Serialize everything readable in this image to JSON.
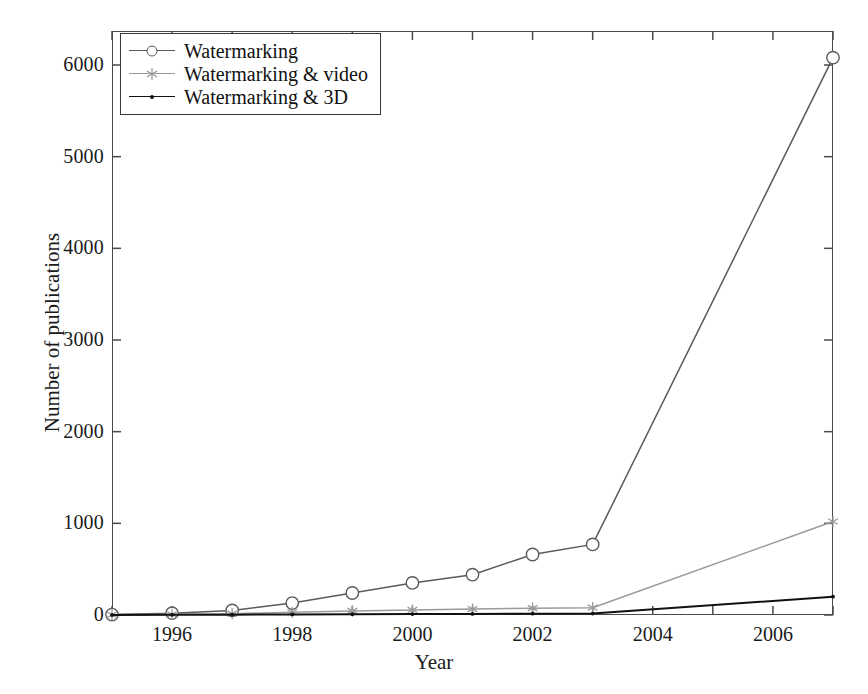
{
  "figure": {
    "background": "#ffffff",
    "frame_color": "#4a4a4a"
  },
  "axes": {
    "xlabel": "Year",
    "ylabel": "Number of publications",
    "x_tick_labels": [
      "1996",
      "1998",
      "2000",
      "2002",
      "2004",
      "2006"
    ],
    "y_tick_labels": [
      "0",
      "1000",
      "2000",
      "3000",
      "4000",
      "5000",
      "6000"
    ]
  },
  "legend": {
    "position": "top-left-inside",
    "entries": [
      {
        "label": "Watermarking",
        "marker": "circle-marker",
        "color": "#5a5a5a"
      },
      {
        "label": "Watermarking & video",
        "marker": "asterisk-marker",
        "color": "#9a9a9a"
      },
      {
        "label": "Watermarking & 3D",
        "marker": "dot-marker",
        "color": "#111111"
      }
    ]
  },
  "chart_data": {
    "type": "line",
    "title": "",
    "xlabel": "Year",
    "ylabel": "Number of publications",
    "xlim": [
      1995,
      2007
    ],
    "ylim": [
      0,
      6500
    ],
    "yticks": [
      0,
      1000,
      2000,
      3000,
      4000,
      5000,
      6000
    ],
    "xticks": [
      1996,
      1998,
      2000,
      2002,
      2004,
      2006
    ],
    "x_minor_ticks": [
      1995,
      1997,
      1999,
      2001,
      2003,
      2005,
      2007
    ],
    "grid": false,
    "legend_position": "upper left",
    "x": [
      1995,
      1996,
      1997,
      1998,
      1999,
      2000,
      2001,
      2002,
      2003,
      2007
    ],
    "series": [
      {
        "name": "Watermarking",
        "color": "#5a5a5a",
        "marker": "o",
        "values": [
          5,
          20,
          50,
          130,
          240,
          350,
          440,
          660,
          770,
          6080
        ]
      },
      {
        "name": "Watermarking & video",
        "color": "#9a9a9a",
        "marker": "*",
        "values": [
          2,
          8,
          15,
          30,
          45,
          55,
          65,
          75,
          80,
          1020
        ]
      },
      {
        "name": "Watermarking & 3D",
        "color": "#111111",
        "marker": ".",
        "values": [
          0,
          2,
          4,
          6,
          8,
          10,
          12,
          14,
          16,
          200
        ]
      }
    ]
  }
}
